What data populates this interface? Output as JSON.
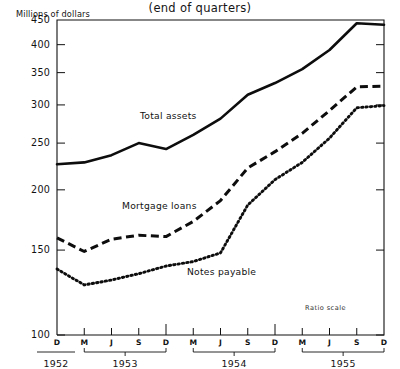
{
  "chart_data": {
    "type": "line",
    "title": "(end of quarters)",
    "ylabel": "Millions of dollars",
    "xlabel": "",
    "scale_note": "Ratio scale",
    "yscale": "log",
    "grid": false,
    "legend_position": "inline-annotations",
    "ylim": [
      100,
      450
    ],
    "yticks": [
      100,
      150,
      200,
      250,
      300,
      350,
      400,
      450
    ],
    "ytick_labels": [
      "100",
      "150",
      "200",
      "250",
      "300",
      "350",
      "400",
      "450"
    ],
    "x": [
      "D 1952",
      "M 1953",
      "J 1953",
      "S 1953",
      "D 1953",
      "M 1954",
      "J 1954",
      "S 1954",
      "D 1954",
      "M 1955",
      "J 1955",
      "S 1955",
      "D 1955"
    ],
    "xtick_labels": [
      "D",
      "M",
      "J",
      "S",
      "D",
      "M",
      "J",
      "S",
      "D",
      "M",
      "J",
      "S",
      "D"
    ],
    "year_groups": [
      {
        "label": "1952",
        "start_index": 0,
        "end_index": 0
      },
      {
        "label": "1953",
        "start_index": 1,
        "end_index": 4
      },
      {
        "label": "1954",
        "start_index": 5,
        "end_index": 8
      },
      {
        "label": "1955",
        "start_index": 9,
        "end_index": 12
      }
    ],
    "series": [
      {
        "name": "Total assets",
        "style": "solid",
        "values": [
          226,
          228,
          236,
          250,
          243,
          260,
          281,
          315,
          333,
          356,
          390,
          443,
          440
        ]
      },
      {
        "name": "Mortgage loans",
        "style": "dashed",
        "values": [
          159,
          149,
          158,
          161,
          160,
          172,
          190,
          222,
          240,
          262,
          292,
          327,
          328
        ]
      },
      {
        "name": "Notes payable",
        "style": "dotted",
        "values": [
          137,
          127,
          130,
          134,
          139,
          142,
          148,
          186,
          210,
          228,
          256,
          296,
          299
        ]
      }
    ],
    "annotations": [
      {
        "text": "Total assets",
        "x_px": 140,
        "y_px": 110
      },
      {
        "text": "Mortgage loans",
        "x_px": 122,
        "y_px": 200
      },
      {
        "text": "Notes payable",
        "x_px": 187,
        "y_px": 266
      },
      {
        "text": "Ratio scale",
        "x_px": 305,
        "y_px": 304
      }
    ]
  }
}
